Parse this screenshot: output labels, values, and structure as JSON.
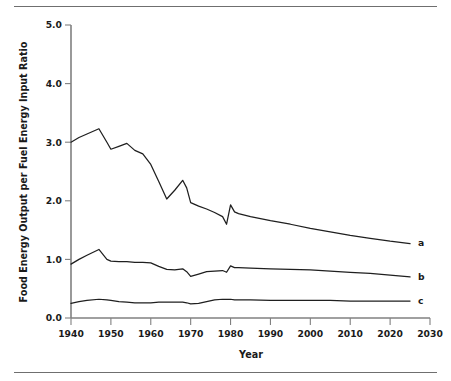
{
  "figure": {
    "has_top_rule": true,
    "has_bottom_rule": true,
    "rule_color": "#6f6f6f",
    "background": "#ffffff",
    "line_color": "#1f1f1f",
    "axis_color": "#808080"
  },
  "chart_data": {
    "type": "line",
    "title": "",
    "xlabel": "Year",
    "ylabel": "Food Energy Output per Fuel Energy Input Ratio",
    "xlim": [
      1940,
      2030
    ],
    "ylim": [
      0.0,
      5.0
    ],
    "xticks": [
      1940,
      1950,
      1960,
      1970,
      1980,
      1990,
      2000,
      2010,
      2020,
      2030
    ],
    "xticklabels": [
      "1940",
      "1950",
      "1960",
      "1970",
      "1980",
      "1990",
      "2000",
      "2010",
      "2020",
      "2030"
    ],
    "yticks": [
      0.0,
      1.0,
      2.0,
      3.0,
      4.0,
      5.0
    ],
    "yticklabels": [
      "0.0",
      "1.0",
      "2.0",
      "3.0",
      "4.0",
      "5.0"
    ],
    "grid": false,
    "legend_position": "right-inline-end-labels",
    "series": [
      {
        "name": "a",
        "label": "a",
        "label_x": 2027,
        "label_y": 1.28,
        "x": [
          1940,
          1942,
          1944,
          1947,
          1949,
          1950,
          1952,
          1954,
          1956,
          1958,
          1960,
          1962,
          1964,
          1966,
          1968,
          1969,
          1970,
          1972,
          1974,
          1976,
          1978,
          1979,
          1980,
          1981,
          1982,
          1985,
          1990,
          1995,
          2000,
          2005,
          2010,
          2015,
          2020,
          2025
        ],
        "values": [
          3.0,
          3.08,
          3.14,
          3.23,
          3.0,
          2.88,
          2.93,
          2.98,
          2.86,
          2.8,
          2.62,
          2.33,
          2.03,
          2.18,
          2.35,
          2.22,
          1.97,
          1.91,
          1.86,
          1.8,
          1.73,
          1.6,
          1.93,
          1.81,
          1.78,
          1.73,
          1.66,
          1.6,
          1.53,
          1.47,
          1.41,
          1.36,
          1.31,
          1.27
        ]
      },
      {
        "name": "b",
        "label": "b",
        "label_x": 2027,
        "label_y": 0.71,
        "x": [
          1940,
          1942,
          1944,
          1947,
          1949,
          1950,
          1952,
          1954,
          1956,
          1958,
          1960,
          1962,
          1964,
          1966,
          1968,
          1969,
          1970,
          1972,
          1974,
          1976,
          1978,
          1979,
          1980,
          1981,
          1982,
          1985,
          1990,
          1995,
          2000,
          2005,
          2010,
          2015,
          2020,
          2025
        ],
        "values": [
          0.92,
          1.0,
          1.07,
          1.17,
          1.0,
          0.97,
          0.96,
          0.96,
          0.95,
          0.95,
          0.94,
          0.88,
          0.83,
          0.82,
          0.84,
          0.79,
          0.71,
          0.75,
          0.79,
          0.8,
          0.81,
          0.78,
          0.89,
          0.86,
          0.86,
          0.85,
          0.84,
          0.83,
          0.82,
          0.8,
          0.78,
          0.76,
          0.73,
          0.7
        ]
      },
      {
        "name": "c",
        "label": "c",
        "label_x": 2027,
        "label_y": 0.29,
        "x": [
          1940,
          1942,
          1944,
          1947,
          1949,
          1950,
          1952,
          1954,
          1956,
          1958,
          1960,
          1962,
          1964,
          1966,
          1968,
          1969,
          1970,
          1972,
          1974,
          1976,
          1978,
          1979,
          1980,
          1981,
          1982,
          1985,
          1990,
          1995,
          2000,
          2005,
          2010,
          2015,
          2020,
          2025
        ],
        "values": [
          0.25,
          0.28,
          0.3,
          0.32,
          0.31,
          0.3,
          0.28,
          0.27,
          0.26,
          0.26,
          0.26,
          0.27,
          0.27,
          0.27,
          0.27,
          0.26,
          0.24,
          0.25,
          0.28,
          0.31,
          0.32,
          0.32,
          0.32,
          0.31,
          0.31,
          0.31,
          0.3,
          0.3,
          0.3,
          0.3,
          0.29,
          0.29,
          0.29,
          0.29
        ]
      }
    ]
  }
}
